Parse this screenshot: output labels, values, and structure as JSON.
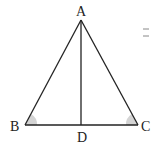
{
  "diagram": {
    "type": "isosceles-triangle-with-altitude",
    "points": {
      "A": {
        "label": "A",
        "x": 81,
        "y": 20
      },
      "B": {
        "label": "B",
        "x": 25,
        "y": 125
      },
      "C": {
        "label": "C",
        "x": 138,
        "y": 125
      },
      "D": {
        "label": "D",
        "x": 81,
        "y": 125
      }
    },
    "segments": [
      "AB",
      "AC",
      "BC",
      "AD"
    ],
    "marked_angles": [
      "B",
      "C"
    ],
    "colors": {
      "line": "#222222",
      "angle_fill": "#cccccc",
      "mark": "#888888"
    }
  }
}
